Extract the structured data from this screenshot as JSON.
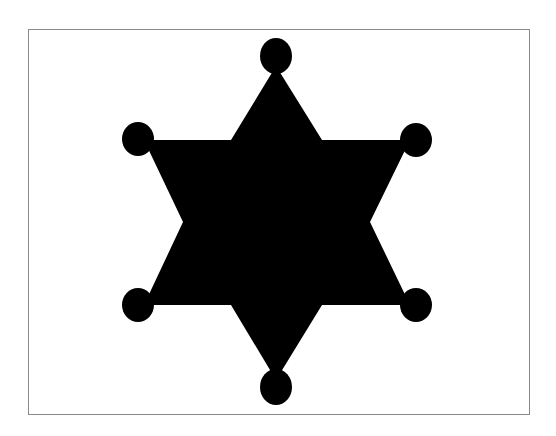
{
  "image": {
    "subject": "six-pointed sheriff badge star",
    "icon": "sheriff-star-icon",
    "colors": {
      "background": "#ffffff",
      "frame_border": "#8a8a8a",
      "shape_fill": "#000000"
    },
    "frame": {
      "x": 28,
      "y": 29,
      "width": 502,
      "height": 386
    },
    "star": {
      "points": "276,66 322,140 410,140 370,222 410,305 322,305 276,380 231,305 144,305 183,222 144,140 231,140",
      "tip_balls": [
        {
          "cx": 276,
          "cy": 56,
          "rx": 16,
          "ry": 18
        },
        {
          "cx": 416,
          "cy": 140,
          "rx": 16,
          "ry": 17
        },
        {
          "cx": 416,
          "cy": 305,
          "rx": 16,
          "ry": 17
        },
        {
          "cx": 276,
          "cy": 387,
          "rx": 16,
          "ry": 18
        },
        {
          "cx": 138,
          "cy": 305,
          "rx": 16,
          "ry": 17
        },
        {
          "cx": 138,
          "cy": 139,
          "rx": 16,
          "ry": 17
        }
      ]
    }
  }
}
